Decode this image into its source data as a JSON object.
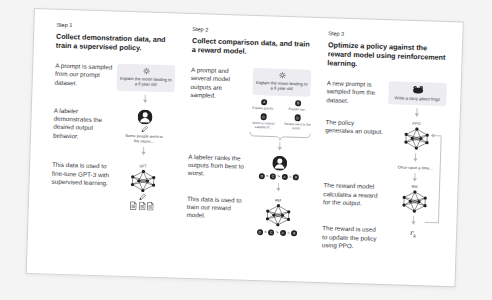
{
  "colors": {
    "box_bg": "#ececf1",
    "text_dark": "#202123",
    "text_body": "#353740",
    "arrow": "#b4b4bb"
  },
  "step1": {
    "label": "Step 1",
    "title": "Collect demonstration data, and train a supervised policy.",
    "sample_text": "A prompt is sampled from our prompt dataset.",
    "prompt": "Explain the moon landing to a 6 year old",
    "labeler_text": "A labeler demonstrates the desired output behavior.",
    "demo_output": "Some people went to the moon...",
    "finetune_text": "This data is used to fine-tune GPT-3 with supervised learning.",
    "model_label": "SFT"
  },
  "step2": {
    "label": "Step 2",
    "title": "Collect comparison data, and train a reward model.",
    "sample_text": "A prompt and several model outputs are sampled.",
    "prompt": "Explain the moon landing to a 6 year old",
    "outputs": [
      {
        "letter": "A",
        "text": "Explain gravity..."
      },
      {
        "letter": "B",
        "text": "Explain war..."
      },
      {
        "letter": "C",
        "text": "Moon is natural satellite of..."
      },
      {
        "letter": "D",
        "text": "People went to the moon..."
      }
    ],
    "rank_text": "A labeler ranks the outputs from best to worst.",
    "ranking": [
      "D",
      ">",
      "C",
      ">",
      "A",
      "=",
      "B"
    ],
    "train_text": "This data is used to train our reward model.",
    "model_label": "RM"
  },
  "step3": {
    "label": "Step 3",
    "title": "Optimize a policy against the reward model using reinforcement learning.",
    "sample_text": "A new prompt is sampled from the dataset.",
    "prompt": "Write a story about frogs",
    "policy_text": "The policy generates an output.",
    "policy_label": "PPO",
    "output_text": "Once upon a time...",
    "reward_text": "The reward model calculates a reward for the output.",
    "rm_label": "RM",
    "update_text": "The reward is used to update the policy using PPO.",
    "reward_base": "r",
    "reward_sub": "k"
  }
}
